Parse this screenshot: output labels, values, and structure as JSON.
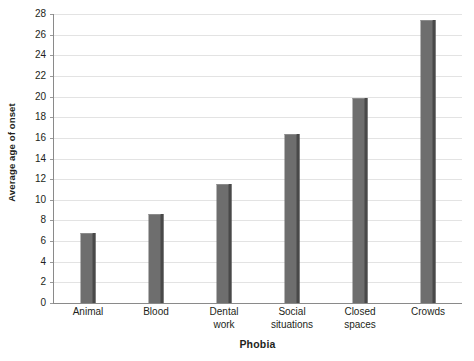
{
  "chart_data": {
    "type": "bar",
    "title": "",
    "xlabel": "Phobia",
    "ylabel": "Average age of onset",
    "categories": [
      "Animal",
      "Blood",
      "Dental work",
      "Social situations",
      "Closed spaces",
      "Crowds"
    ],
    "values": [
      6.8,
      8.6,
      11.5,
      16.4,
      19.9,
      27.4
    ],
    "ylim": [
      0,
      28
    ],
    "yticks": [
      0,
      2,
      4,
      6,
      8,
      10,
      12,
      14,
      16,
      18,
      20,
      22,
      24,
      26,
      28
    ],
    "ytick_labels": [
      "0",
      "2",
      "4",
      "6",
      "8",
      "10",
      "12",
      "14",
      "16",
      "18",
      "20",
      "22",
      "24",
      "26",
      "28"
    ],
    "grid": true,
    "legend": false,
    "legend_position": "none",
    "bar_color": "#6e6e6e",
    "bar_edge_color": "#494949",
    "gridline_color": "#e3e3e3",
    "axis_color": "#8a8a8a",
    "text_color": "#231f20",
    "background": "#ffffff"
  },
  "axis": {
    "x_title": "Phobia",
    "y_title": "Average age of onset"
  },
  "x_labels": [
    {
      "line1": "Animal",
      "text": "Animal"
    },
    {
      "line1": "Blood",
      "text": "Blood"
    },
    {
      "line1": "Dental",
      "line2": "work",
      "text": "Dental\nwork"
    },
    {
      "line1": "Social",
      "line2": "situations",
      "text": "Social\nsituations"
    },
    {
      "line1": "Closed",
      "line2": "spaces",
      "text": "Closed\nspaces"
    },
    {
      "line1": "Crowds",
      "text": "Crowds"
    }
  ]
}
